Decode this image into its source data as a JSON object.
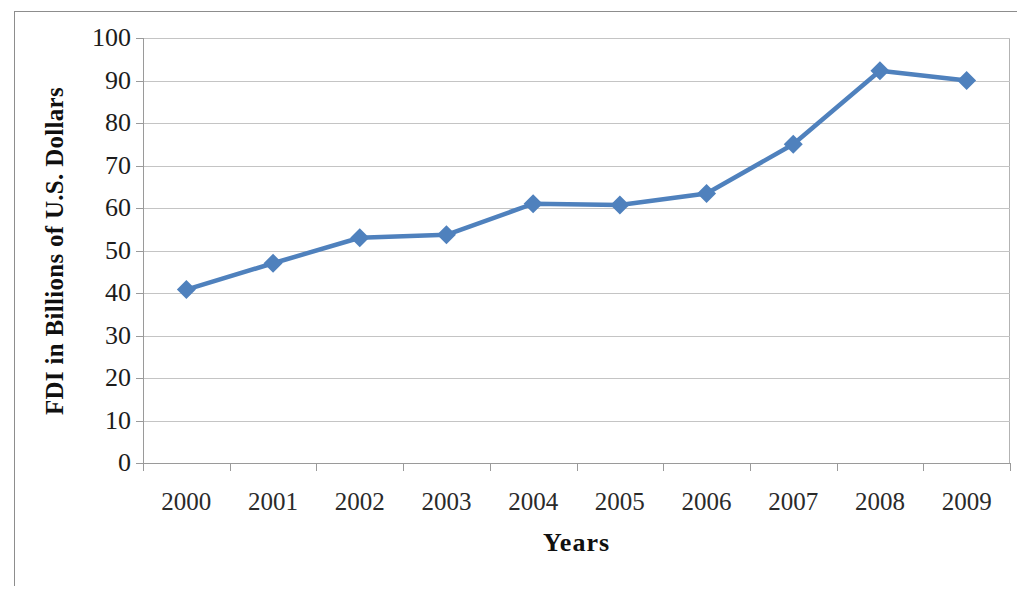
{
  "chart_data": {
    "type": "line",
    "title": "",
    "xlabel": "Years",
    "ylabel": "FDI in Billions of U.S. Dollars",
    "categories": [
      "2000",
      "2001",
      "2002",
      "2003",
      "2004",
      "2005",
      "2006",
      "2007",
      "2008",
      "2009"
    ],
    "values": [
      40.8,
      47.0,
      53.0,
      53.7,
      61.0,
      60.7,
      63.4,
      75.0,
      92.3,
      90.0
    ],
    "series": [
      {
        "name": "FDI",
        "values": [
          40.8,
          47.0,
          53.0,
          53.7,
          61.0,
          60.7,
          63.4,
          75.0,
          92.3,
          90.0
        ]
      }
    ],
    "ylim": [
      0,
      100
    ],
    "y_ticks": [
      0,
      10,
      20,
      30,
      40,
      50,
      60,
      70,
      80,
      90,
      100
    ],
    "y_tick_labels": [
      "0",
      "10",
      "20",
      "30",
      "40",
      "50",
      "60",
      "70",
      "80",
      "90",
      "100"
    ],
    "grid": "horizontal",
    "legend": "none",
    "marker": "diamond",
    "line_color": "#4F81BD",
    "marker_color": "#4F81BD",
    "gridline_color": "#C4C4C4",
    "axis_color": "#9A9A9A",
    "background_color": "#FFFFFF",
    "text_color": "#1C1C1C"
  }
}
